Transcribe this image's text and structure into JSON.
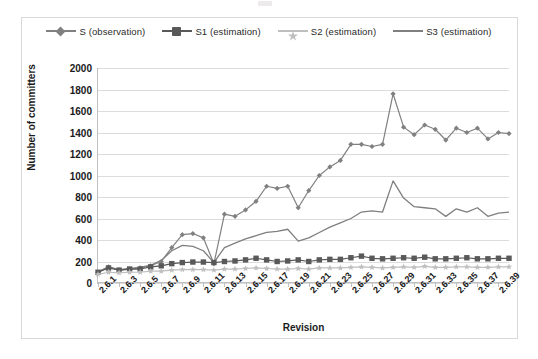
{
  "chart_data": {
    "type": "line",
    "title": "",
    "xlabel": "Revision",
    "ylabel": "Number of committers",
    "ylim": [
      0,
      2000
    ],
    "ytick_step": 200,
    "yticks": [
      2000,
      1800,
      1600,
      1400,
      1200,
      1000,
      800,
      600,
      400,
      200,
      0
    ],
    "grid": true,
    "legend_position": "top",
    "x": [
      "2.6.1",
      "2.6.2",
      "2.6.3",
      "2.6.4",
      "2.6.5",
      "2.6.6",
      "2.6.7",
      "2.6.8",
      "2.6.9",
      "2.6.10",
      "2.6.11",
      "2.6.12",
      "2.6.13",
      "2.6.14",
      "2.6.15",
      "2.6.16",
      "2.6.17",
      "2.6.18",
      "2.6.19",
      "2.6.20",
      "2.6.21",
      "2.6.22",
      "2.6.23",
      "2.6.24",
      "2.6.25",
      "2.6.26",
      "2.6.27",
      "2.6.28",
      "2.6.29",
      "2.6.30",
      "2.6.31",
      "2.6.32",
      "2.6.33",
      "2.6.34",
      "2.6.35",
      "2.6.36",
      "2.6.37",
      "2.6.38",
      "2.6.39",
      "2.6.40"
    ],
    "xtick_labels": [
      "2.6.1",
      "2.6.3",
      "2.6.5",
      "2.6.7",
      "2.6.9",
      "2.6.11",
      "2.6.13",
      "2.6.15",
      "2.6.17",
      "2.6.19",
      "2.6.21",
      "2.6.23",
      "2.6.25",
      "2.6.27",
      "2.6.29",
      "2.6.31",
      "2.6.33",
      "2.6.35",
      "2.6.37",
      "2.6.39"
    ],
    "series": [
      {
        "name": "S (observation)",
        "marker": "diamond",
        "color": "#808080",
        "values": [
          95,
          150,
          120,
          130,
          140,
          160,
          200,
          330,
          450,
          460,
          420,
          180,
          640,
          620,
          680,
          760,
          900,
          880,
          900,
          700,
          860,
          1000,
          1080,
          1140,
          1290,
          1290,
          1270,
          1290,
          1760,
          1450,
          1380,
          1470,
          1430,
          1330,
          1440,
          1400,
          1440,
          1340,
          1400,
          1390
        ]
      },
      {
        "name": "S1 (estimation)",
        "marker": "square",
        "color": "#595959",
        "values": [
          100,
          140,
          120,
          130,
          130,
          150,
          160,
          180,
          190,
          195,
          195,
          190,
          200,
          205,
          215,
          230,
          215,
          200,
          205,
          215,
          200,
          215,
          220,
          220,
          235,
          250,
          230,
          225,
          230,
          235,
          230,
          240,
          225,
          225,
          230,
          235,
          225,
          225,
          230,
          230
        ]
      },
      {
        "name": "S2 (estimation)",
        "marker": "star",
        "color": "#bfbfbf",
        "values": [
          80,
          100,
          95,
          100,
          100,
          110,
          110,
          120,
          125,
          125,
          125,
          120,
          130,
          130,
          135,
          140,
          135,
          130,
          130,
          135,
          130,
          140,
          140,
          140,
          145,
          150,
          145,
          140,
          145,
          150,
          145,
          155,
          145,
          145,
          150,
          150,
          145,
          145,
          150,
          150
        ]
      },
      {
        "name": "S3 (estimation)",
        "marker": "none",
        "color": "#7f7f7f",
        "values": [
          105,
          150,
          125,
          135,
          145,
          165,
          210,
          300,
          350,
          340,
          300,
          190,
          330,
          370,
          410,
          440,
          470,
          480,
          500,
          390,
          420,
          470,
          520,
          560,
          600,
          660,
          670,
          660,
          950,
          790,
          710,
          700,
          690,
          620,
          690,
          660,
          700,
          620,
          650,
          660
        ]
      }
    ]
  },
  "legend": {
    "items": [
      {
        "label": "S (observation)",
        "marker": "diamond",
        "color": "#808080"
      },
      {
        "label": "S1 (estimation)",
        "marker": "square",
        "color": "#595959"
      },
      {
        "label": "S2 (estimation)",
        "marker": "star",
        "color": "#bfbfbf"
      },
      {
        "label": "S3 (estimation)",
        "marker": "none",
        "color": "#7f7f7f"
      }
    ]
  },
  "axes": {
    "y_title": "Number of committers",
    "x_title": "Revision"
  }
}
